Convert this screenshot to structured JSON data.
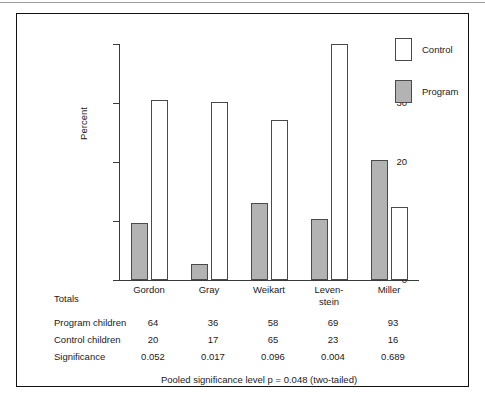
{
  "chart_data": {
    "type": "bar",
    "title": "",
    "xlabel": "",
    "ylabel": "Percent",
    "ylim": [
      0,
      40
    ],
    "yticks": [
      0,
      10,
      20,
      30,
      40
    ],
    "grid": false,
    "legend_position": "top-right",
    "categories": [
      "Gordon",
      "Gray",
      "Weikart",
      "Leven-stein",
      "Miller"
    ],
    "category_lines": [
      [
        "Gordon"
      ],
      [
        "Gray"
      ],
      [
        "Weikart"
      ],
      [
        "Leven-",
        "stein"
      ],
      [
        "Miller"
      ]
    ],
    "series": [
      {
        "name": "Program",
        "values": [
          9.6,
          2.7,
          13.0,
          10.4,
          20.3
        ],
        "color": "#b3b3b3"
      },
      {
        "name": "Control",
        "values": [
          30.5,
          30.1,
          27.2,
          40.0,
          12.4
        ],
        "color": "#ffffff"
      }
    ]
  },
  "legend": {
    "items": [
      {
        "label": "Control",
        "style": "control"
      },
      {
        "label": "Program",
        "style": "program"
      }
    ]
  },
  "axis": {
    "y_label": "Percent",
    "y_ticks": [
      "40",
      "30",
      "20",
      "10",
      "0"
    ]
  },
  "table": {
    "totals_label": "Totals",
    "columns": [
      "Gordon",
      "Gray",
      "Weikart",
      "Leven-stein",
      "Miller"
    ],
    "rows": [
      {
        "label": "Program children",
        "values": [
          "64",
          "36",
          "58",
          "69",
          "93"
        ]
      },
      {
        "label": "Control children",
        "values": [
          "20",
          "17",
          "65",
          "23",
          "16"
        ]
      },
      {
        "label": "Significance",
        "values": [
          "0.052",
          "0.017",
          "0.096",
          "0.004",
          "0.689"
        ]
      }
    ],
    "footnote": "Pooled significance level p  =  0.048 (two-tailed)"
  }
}
